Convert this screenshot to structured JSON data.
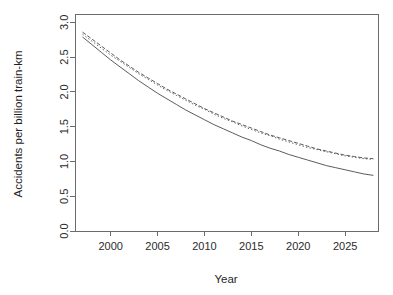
{
  "chart_data": {
    "type": "line",
    "title": "",
    "xlabel": "Year",
    "ylabel": "Accidents per billion train-km",
    "xlim": [
      1996.2,
      2028.5
    ],
    "ylim": [
      0.0,
      3.12
    ],
    "grid": false,
    "legend": "none",
    "xticks": [
      2000,
      2005,
      2010,
      2015,
      2020,
      2025
    ],
    "xtick_labels": [
      "2000",
      "2005",
      "2010",
      "2015",
      "2020",
      "2025"
    ],
    "yticks": [
      0.0,
      0.5,
      1.0,
      1.5,
      2.0,
      2.5,
      3.0
    ],
    "ytick_labels": [
      "0.0",
      "0.5",
      "1.0",
      "1.5",
      "2.0",
      "2.5",
      "3.0"
    ],
    "x": [
      1997,
      1998,
      1999,
      2000,
      2001,
      2002,
      2003,
      2004,
      2005,
      2006,
      2007,
      2008,
      2009,
      2010,
      2011,
      2012,
      2013,
      2014,
      2015,
      2016,
      2017,
      2018,
      2019,
      2020,
      2021,
      2022,
      2023,
      2024,
      2025,
      2026,
      2027,
      2028
    ],
    "series": [
      {
        "name": "upper-dashed",
        "style": "dashed",
        "color": "#5c5c5c",
        "dash": "4,2",
        "values": [
          2.86,
          2.76,
          2.66,
          2.56,
          2.46,
          2.37,
          2.28,
          2.2,
          2.12,
          2.04,
          1.97,
          1.9,
          1.83,
          1.76,
          1.7,
          1.64,
          1.58,
          1.53,
          1.48,
          1.43,
          1.38,
          1.34,
          1.3,
          1.26,
          1.22,
          1.18,
          1.15,
          1.12,
          1.09,
          1.07,
          1.05,
          1.04
        ]
      },
      {
        "name": "middle-dotted",
        "style": "dotted",
        "color": "#5c5c5c",
        "dash": "1.4,2.2",
        "values": [
          2.83,
          2.73,
          2.63,
          2.53,
          2.44,
          2.35,
          2.26,
          2.18,
          2.1,
          2.02,
          1.95,
          1.88,
          1.81,
          1.75,
          1.68,
          1.62,
          1.57,
          1.51,
          1.46,
          1.41,
          1.37,
          1.32,
          1.28,
          1.24,
          1.2,
          1.17,
          1.14,
          1.11,
          1.08,
          1.06,
          1.04,
          1.03
        ]
      },
      {
        "name": "lower-solid",
        "style": "solid",
        "color": "#5c5c5c",
        "dash": "none",
        "values": [
          2.79,
          2.68,
          2.57,
          2.46,
          2.36,
          2.26,
          2.16,
          2.07,
          1.98,
          1.9,
          1.82,
          1.74,
          1.67,
          1.6,
          1.53,
          1.47,
          1.41,
          1.35,
          1.3,
          1.24,
          1.19,
          1.15,
          1.1,
          1.06,
          1.02,
          0.98,
          0.94,
          0.91,
          0.88,
          0.85,
          0.82,
          0.8
        ]
      }
    ]
  },
  "plot_box": {
    "left": 75,
    "right": 378,
    "top": 14,
    "bottom": 231
  }
}
